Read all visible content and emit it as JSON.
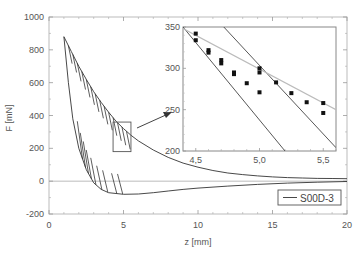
{
  "chart_data": [
    {
      "id": "main",
      "type": "line",
      "title": "",
      "xlabel": "z [mm]",
      "ylabel": "F [mN]",
      "xlim": [
        0,
        20
      ],
      "ylim": [
        -200,
        1000
      ],
      "xticks": [
        0,
        5,
        10,
        15,
        20
      ],
      "xtick_labels": [
        "0",
        "5",
        "10",
        "15",
        "20"
      ],
      "yticks": [
        -200,
        0,
        200,
        400,
        600,
        800,
        1000
      ],
      "ytick_labels": [
        "-200",
        "0",
        "200",
        "400",
        "600",
        "800",
        "1000"
      ],
      "grid": false,
      "zero_line": true,
      "legend": {
        "position": "bottom-right",
        "entries": [
          "S00D-3"
        ]
      },
      "series": [
        {
          "name": "S00D-3 approach (upper envelope)",
          "x": [
            1.0,
            1.5,
            2.0,
            2.5,
            3.0,
            3.5,
            4.0,
            4.5,
            5.0,
            5.5,
            6.0,
            7.0,
            8.0,
            9.0,
            10.0,
            11.0,
            12.0,
            13.0,
            14.0,
            15.0,
            16.0,
            17.0,
            18.0,
            19.0,
            20.0
          ],
          "y": [
            880,
            790,
            700,
            620,
            545,
            480,
            420,
            365,
            320,
            280,
            245,
            190,
            145,
            110,
            85,
            65,
            50,
            40,
            32,
            26,
            22,
            19,
            17,
            16,
            15
          ]
        },
        {
          "name": "S00D-3 retract (lower branch)",
          "x": [
            1.0,
            1.3,
            1.6,
            2.0,
            2.5,
            3.0,
            3.5,
            4.0,
            5.0,
            6.0,
            7.0,
            8.0,
            9.0,
            10.0,
            12.0,
            14.0,
            16.0,
            18.0,
            20.0
          ],
          "y": [
            880,
            600,
            380,
            200,
            70,
            -10,
            -50,
            -70,
            -80,
            -78,
            -70,
            -60,
            -50,
            -42,
            -30,
            -20,
            -12,
            -6,
            -2
          ]
        }
      ],
      "annotation": {
        "type": "zoom-box",
        "x_range": [
          4.3,
          5.5
        ],
        "y_range": [
          180,
          360
        ],
        "arrow_to": "inset"
      }
    },
    {
      "id": "inset",
      "type": "scatter",
      "xlim": [
        4.4,
        5.6
      ],
      "ylim": [
        200,
        350
      ],
      "xticks": [
        4.5,
        5.0,
        5.5
      ],
      "xtick_labels": [
        "4,5",
        "5,0",
        "5,5"
      ],
      "yticks": [
        200,
        250,
        300,
        350
      ],
      "ytick_labels": [
        "200",
        "250",
        "300",
        "350"
      ],
      "series": [
        {
          "name": "points-left",
          "x": [
            4.5,
            4.5,
            4.6,
            4.6,
            4.7,
            4.7,
            4.8,
            4.8,
            4.9,
            5.0
          ],
          "y": [
            342,
            334,
            322,
            319,
            310,
            306,
            295,
            293,
            282,
            271
          ]
        },
        {
          "name": "points-right",
          "x": [
            5.0,
            5.0,
            5.13,
            5.25,
            5.37,
            5.5
          ],
          "y": [
            300,
            295,
            283,
            270,
            259,
            246
          ]
        },
        {
          "name": "point-outlier",
          "x": [
            5.5
          ],
          "y": [
            258
          ]
        }
      ],
      "lines": [
        {
          "name": "fit-left",
          "color": "#444444",
          "x": [
            4.4,
            5.2
          ],
          "y": [
            350,
            200
          ]
        },
        {
          "name": "fit-right",
          "color": "#444444",
          "x": [
            4.72,
            5.6
          ],
          "y": [
            350,
            204
          ]
        },
        {
          "name": "envelope",
          "color": "#bbbbbb",
          "x": [
            4.4,
            5.6
          ],
          "y": [
            348,
            250
          ]
        }
      ]
    }
  ]
}
